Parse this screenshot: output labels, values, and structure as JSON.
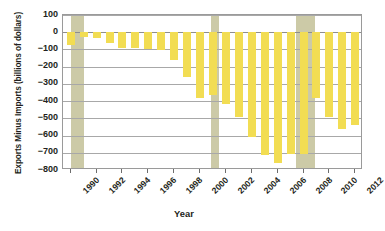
{
  "chart_data": {
    "type": "bar",
    "title": "",
    "xlabel": "Year",
    "ylabel": "Exports Minus Imports (billions of dollars)",
    "categories": [
      1990,
      1991,
      1992,
      1993,
      1994,
      1995,
      1996,
      1997,
      1998,
      1999,
      2000,
      2001,
      2002,
      2003,
      2004,
      2005,
      2006,
      2007,
      2008,
      2009,
      2010,
      2011,
      2012
    ],
    "values": [
      -77,
      -27,
      -34,
      -65,
      -93,
      -91,
      -96,
      -101,
      -160,
      -261,
      -380,
      -365,
      -418,
      -494,
      -610,
      -715,
      -760,
      -705,
      -709,
      -384,
      -494,
      -560,
      -540
    ],
    "series": [
      {
        "name": "Exports Minus Imports",
        "values": [
          -77,
          -27,
          -34,
          -65,
          -93,
          -91,
          -96,
          -101,
          -160,
          -261,
          -380,
          -365,
          -418,
          -494,
          -610,
          -715,
          -760,
          -705,
          -709,
          -384,
          -494,
          -560,
          -540
        ]
      }
    ],
    "ylim": [
      -800,
      100
    ],
    "yticks": [
      100,
      0,
      -100,
      -200,
      -300,
      -400,
      -500,
      -600,
      -700,
      -800
    ],
    "ytick_labels": [
      "100",
      "0",
      "−100",
      "−200",
      "−300",
      "−400",
      "−500",
      "−600",
      "−700",
      "−800"
    ],
    "xtick_labels": [
      "1990",
      "1992",
      "1994",
      "1996",
      "1998",
      "2000",
      "2002",
      "2004",
      "2006",
      "2008",
      "2010",
      "2012"
    ],
    "xtick_values": [
      1990,
      1992,
      1994,
      1996,
      1998,
      2000,
      2002,
      2004,
      2006,
      2008,
      2010,
      2012
    ],
    "xlim": [
      1989.4,
      2012.6
    ],
    "grid": true,
    "legend": "none",
    "bar_color": "#f2dd53",
    "grid_color": "#a8a8a8",
    "axis_color": "#9a9a9a",
    "recession_color": "#c9c7a2",
    "recession_bands": [
      {
        "label": "1990-1991 recession",
        "start": 1990.0,
        "end": 1991.0
      },
      {
        "label": "2001 recession",
        "start": 2000.85,
        "end": 2001.45
      },
      {
        "label": "2007-2009 recession",
        "start": 2007.4,
        "end": 2008.85
      }
    ]
  }
}
